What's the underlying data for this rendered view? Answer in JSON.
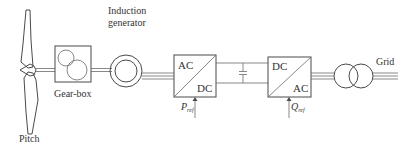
{
  "diagram": {
    "type": "wind turbine power conversion chain",
    "components": {
      "rotor": {
        "label": "Pitch"
      },
      "gearbox": {
        "label": "Gear-box"
      },
      "generator": {
        "label_line1": "Induction",
        "label_line2": "generator"
      },
      "rectifier": {
        "top": "AC",
        "bottom": "DC",
        "control_symbol": "P",
        "control_sub": "ref"
      },
      "dc_link": {
        "element": "capacitor"
      },
      "inverter": {
        "top": "DC",
        "bottom": "AC",
        "control_symbol": "Q",
        "control_sub": "ref"
      },
      "transformer": {
        "element": "two-winding transformer"
      },
      "grid": {
        "label": "Grid"
      }
    },
    "connections": [
      "rotor -> gearbox (shaft)",
      "gearbox -> generator (shaft)",
      "generator -> rectifier (3-phase)",
      "rectifier -> inverter (DC link with capacitor)",
      "inverter -> transformer (3-phase)",
      "transformer -> grid (3-phase)"
    ],
    "colors": {
      "line": "#4a4a4a",
      "text": "#333333",
      "background": "#ffffff"
    }
  }
}
